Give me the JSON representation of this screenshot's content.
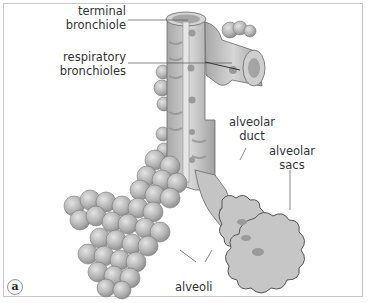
{
  "figure": {
    "panel_letter": "a",
    "labels": {
      "terminal_bronchiole": [
        "terminal",
        "bronchiole"
      ],
      "respiratory_bronchioles": [
        "respiratory",
        "bronchioles"
      ],
      "alveolar_duct": [
        "alveolar",
        "duct"
      ],
      "alveolar_sacs": [
        "alveolar",
        "sacs"
      ],
      "alveoli": "alveoli"
    },
    "colors": {
      "tissue": "#c9c9c9",
      "tissue_dark": "#8e8e8e",
      "tissue_light": "#e2e2e2",
      "leader_line": "#555555",
      "border": "#c8c8c8"
    }
  }
}
